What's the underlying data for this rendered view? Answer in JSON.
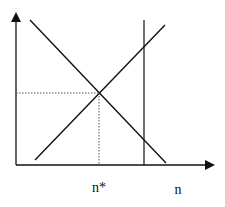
{
  "diagram": {
    "type": "economics-equilibrium",
    "colors": {
      "line": "#111111",
      "dotted": "#555555",
      "background": "#ffffff"
    },
    "axes": {
      "x_label": "n",
      "y_label": ""
    },
    "equilibrium": {
      "x_label": "n*"
    },
    "lines": [
      {
        "name": "downward-sloping-curve"
      },
      {
        "name": "upward-sloping-curve"
      },
      {
        "name": "vertical-line"
      }
    ]
  }
}
